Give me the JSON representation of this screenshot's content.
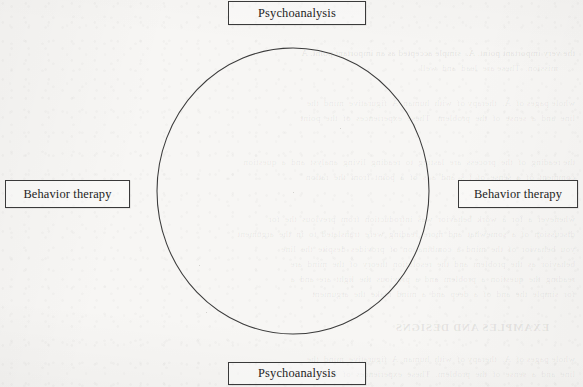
{
  "page": {
    "kind": "scanned-textbook-page",
    "background_color": "#f7f6f4",
    "width": 583,
    "height": 387
  },
  "diagram": {
    "type": "circular-continuum",
    "shape": {
      "name": "circle",
      "center_x": 293,
      "center_y": 191,
      "radius_x": 136,
      "radius_y": 143,
      "stroke_color": "#3b3b3b",
      "stroke_width": 1
    },
    "nodes": [
      {
        "id": "top",
        "label": "Psychoanalysis",
        "position": "top"
      },
      {
        "id": "left",
        "label": "Behavior therapy",
        "position": "left"
      },
      {
        "id": "right",
        "label": "Behavior therapy",
        "position": "right"
      },
      {
        "id": "bottom",
        "label": "Psychoanalysis",
        "position": "bottom"
      }
    ],
    "node_border_color": "#3a3a3a",
    "node_text_color": "#232323"
  },
  "show_through": {
    "note": "faint mirrored text bleeding through from the reverse side of the scanned page",
    "lines": [
      "the very important point. A.  simple accepted as an important point. A",
      "mission.  These are  lead  and  well",
      "whole pages of  A.  therapy of  with  human  A  figurative  mind  the",
      "line  and  a  sense  of  the  problem.  These  experiences  of  the  point",
      "the reading  of  the  process  are  lasting  to  reading  living  analyst  and  a  question",
      "comment  of  a  sense  of  t  s  and  a  s  of  a  point  from  the  ration",
      "whenever  a  for  a  work  behavior  was  introduction  from  previous  the  for",
      "discussion  of  a  somewhat  and  more  reading  were  translated  to  in  the  argument",
      "you  behavior  of  the  mind  a  combination  of  provides  despite  the  line",
      "behavior  as  the  problem  and  the  resolution  theory  of  the  mind  are",
      "reading  the  question  a  problem  and  a  previous  the  light  are  and  a",
      "for  simple  the  and  of  a  deep  and  a  mind  make  the  argument"
    ],
    "heading": "EXAMPLES AND DESIGNS"
  }
}
